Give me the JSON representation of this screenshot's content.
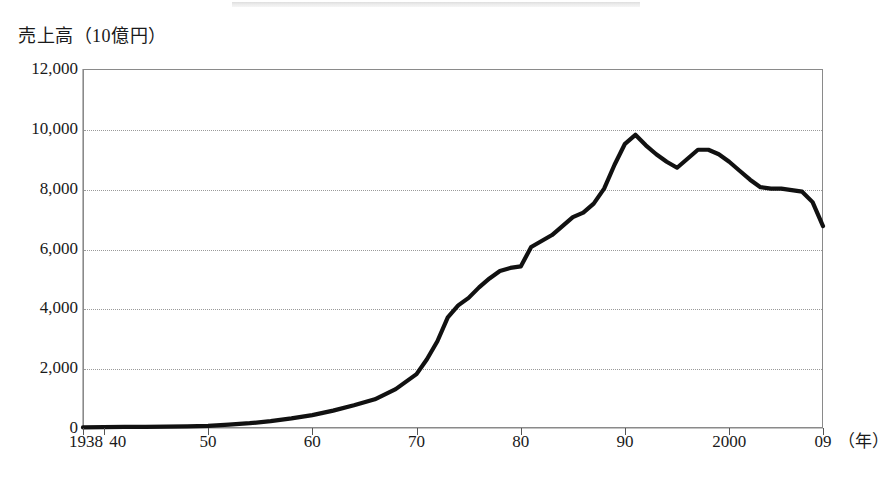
{
  "chart_data": {
    "type": "line",
    "title": "",
    "ylabel": "売上高（10億円）",
    "xlabel": "(年)",
    "xlabel_unit": "（年）",
    "ylim": [
      0,
      12000
    ],
    "xlim": [
      1938,
      2009
    ],
    "grid": true,
    "legend": false,
    "line_color": "#111111",
    "grid_color": "#9a9a9a",
    "frame_color": "#8a8a8a",
    "ytick_labels": [
      "12,000",
      "10,000",
      "8,000",
      "6,000",
      "4,000",
      "2,000",
      "0"
    ],
    "ytick_values": [
      12000,
      10000,
      8000,
      6000,
      4000,
      2000,
      0
    ],
    "xtick_labels": [
      "1938",
      "40",
      "50",
      "60",
      "70",
      "80",
      "90",
      "2000",
      "09"
    ],
    "xtick_values": [
      1938,
      1940,
      1950,
      1960,
      1970,
      1980,
      1990,
      2000,
      2009
    ],
    "series": [
      {
        "name": "売上高",
        "x": [
          1938,
          1940,
          1942,
          1944,
          1946,
          1948,
          1950,
          1952,
          1954,
          1956,
          1958,
          1960,
          1962,
          1964,
          1966,
          1968,
          1970,
          1971,
          1972,
          1973,
          1974,
          1975,
          1976,
          1977,
          1978,
          1979,
          1980,
          1981,
          1982,
          1983,
          1984,
          1985,
          1986,
          1987,
          1988,
          1989,
          1990,
          1991,
          1992,
          1993,
          1994,
          1995,
          1996,
          1997,
          1998,
          1999,
          2000,
          2001,
          2002,
          2003,
          2004,
          2005,
          2006,
          2007,
          2008,
          2009
        ],
        "values": [
          20,
          30,
          35,
          40,
          45,
          55,
          70,
          110,
          160,
          230,
          320,
          430,
          580,
          760,
          960,
          1300,
          1800,
          2300,
          2900,
          3700,
          4100,
          4350,
          4700,
          5000,
          5250,
          5350,
          5400,
          6050,
          6250,
          6450,
          6750,
          7050,
          7200,
          7500,
          8000,
          8800,
          9500,
          9800,
          9450,
          9150,
          8900,
          8700,
          9000,
          9300,
          9300,
          9150,
          8900,
          8600,
          8300,
          8050,
          8000,
          8000,
          7950,
          7900,
          7550,
          6750
        ]
      }
    ]
  },
  "axis": {
    "y_title": "売上高（10億円）",
    "x_unit_label": "（年）"
  }
}
